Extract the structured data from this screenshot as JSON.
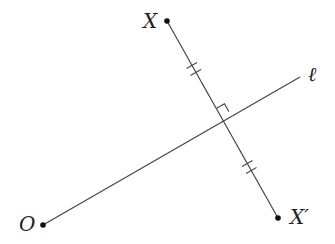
{
  "diagram": {
    "type": "geometry-reflection",
    "colors": {
      "line": "#444444",
      "point": "#111111",
      "label": "#222222",
      "background": "#ffffff"
    },
    "points": [
      {
        "id": "X",
        "label": "X",
        "x": 167,
        "y": 21
      },
      {
        "id": "Xp",
        "label": "X′",
        "x": 278,
        "y": 218
      },
      {
        "id": "O",
        "label": "O",
        "x": 43,
        "y": 225
      }
    ],
    "lines": [
      {
        "id": "ell",
        "label": "ℓ",
        "from": [
          43,
          225
        ],
        "to": [
          300,
          77
        ]
      },
      {
        "id": "XXp",
        "label": "",
        "from": [
          167,
          21
        ],
        "to": [
          278,
          218
        ]
      }
    ],
    "intersection": {
      "x": 221,
      "y": 116
    },
    "annotations": {
      "right_angle": true,
      "congruent_ticks": [
        {
          "segment": "X-intersection",
          "count": 2
        },
        {
          "segment": "intersection-X'",
          "count": 2
        }
      ]
    },
    "labels": {
      "X": "X",
      "Xp": "X′",
      "O": "O",
      "ell": "ℓ"
    }
  }
}
